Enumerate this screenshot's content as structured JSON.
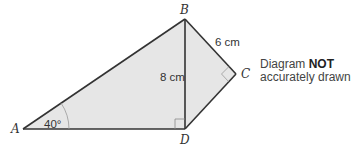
{
  "diagram": {
    "vertices": {
      "A": {
        "label": "A",
        "x": 23,
        "y": 129
      },
      "B": {
        "label": "B",
        "x": 185,
        "y": 19
      },
      "C": {
        "label": "C",
        "x": 236,
        "y": 74
      },
      "D": {
        "label": "D",
        "x": 185,
        "y": 129
      }
    },
    "measurements": {
      "BD": "8 cm",
      "BC": "6 cm",
      "angle_A": "40°"
    },
    "right_angles": [
      "D",
      "C"
    ],
    "note": {
      "prefix": "Diagram ",
      "emphasis": "NOT",
      "suffix": "accurately drawn"
    },
    "colors": {
      "fill": "#e6e6e6",
      "stroke": "#333333"
    }
  }
}
